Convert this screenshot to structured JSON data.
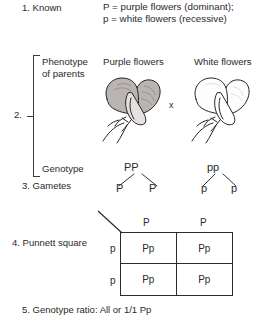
{
  "steps": {
    "known": {
      "number": "1. Known",
      "dominant_line": "P = purple flowers (dominant);",
      "recessive_line": "p = white flowers (recessive)"
    },
    "parents": {
      "number": "2.",
      "phenotype_label_line1": "Phenotype",
      "phenotype_label_line2": "of parents",
      "genotype_label": "Genotype",
      "parent1_title": "Purple flowers",
      "parent2_title": "White flowers",
      "cross_symbol": "x",
      "parent1_genotype": "PP",
      "parent2_genotype": "pp"
    },
    "gametes": {
      "number": "3. Gametes",
      "parent1_gamete_a": "P",
      "parent1_gamete_b": "P",
      "parent2_gamete_a": "p",
      "parent2_gamete_b": "p"
    },
    "punnett": {
      "number": "4. Punnett square",
      "column_headers": [
        "P",
        "P"
      ],
      "row_headers": [
        "p",
        "p"
      ],
      "cells": [
        [
          "Pp",
          "Pp"
        ],
        [
          "Pp",
          "Pp"
        ]
      ]
    },
    "ratio": {
      "number": "5. Genotype ratio: All or 1/1 Pp"
    }
  },
  "colors": {
    "ink": "#2a2a2a",
    "line": "#2b2b2b",
    "purple_flower_fill": "#b9b4b2",
    "white_flower_fill": "#fdfdfd",
    "background": "#ffffff"
  }
}
